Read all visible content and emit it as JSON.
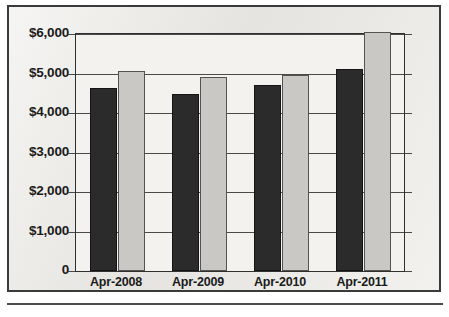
{
  "chart_data": {
    "type": "bar",
    "title": "",
    "subtitle": "",
    "xlabel": "",
    "ylabel": "",
    "categories": [
      "Apr-2008",
      "Apr-2009",
      "Apr-2010",
      "Apr-2011"
    ],
    "series": [
      {
        "name": "series-1",
        "color": "#2b2b2b",
        "values": [
          4640,
          4470,
          4720,
          5120
        ]
      },
      {
        "name": "series-2",
        "color": "#c9c8c4",
        "values": [
          5070,
          4900,
          4950,
          6050
        ]
      }
    ],
    "ylim": [
      0,
      6000
    ],
    "ytick_values": [
      6000,
      5000,
      4000,
      3000,
      2000,
      1000,
      0
    ],
    "ytick_labels": [
      "$6,000",
      "$5,000",
      "$4,000",
      "$3,000",
      "$2,000",
      "$1,000",
      "0"
    ],
    "grid": true,
    "grid_axis": "y",
    "legend": false,
    "legend_position": "none",
    "annotations": [],
    "axis_line_color": "#2f2f2f",
    "plot_background": "#f3f2ef",
    "figure_background": "#e9e8e4"
  }
}
